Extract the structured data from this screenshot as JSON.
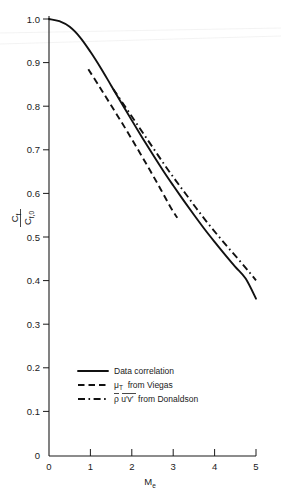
{
  "chart_data": {
    "type": "line",
    "title": "",
    "xlabel": "M_e",
    "ylabel": "C_f / C_f,0",
    "xlim": [
      0,
      5
    ],
    "ylim": [
      0,
      1.0
    ],
    "grid": false,
    "legend_position": "lower-left-inside",
    "x_ticks": [
      "0",
      "1",
      "2",
      "3",
      "4",
      "5"
    ],
    "x_tick_values": [
      0,
      1,
      2,
      3,
      4,
      5
    ],
    "y_ticks": [
      "0",
      "0.1",
      "0.2",
      "0.3",
      "0.4",
      "0.5",
      "0.6",
      "0.7",
      "0.8",
      "0.9",
      "1.0"
    ],
    "y_tick_values": [
      0,
      0.1,
      0.2,
      0.3,
      0.4,
      0.5,
      0.6,
      0.7,
      0.8,
      0.9,
      1.0
    ],
    "series": [
      {
        "name": "Data correlation",
        "style": "solid",
        "x": [
          0,
          0.25,
          0.5,
          0.75,
          1.0,
          1.25,
          1.5,
          1.75,
          2.0,
          2.25,
          2.5,
          2.75,
          3.0,
          3.25,
          3.5,
          3.75,
          4.0,
          4.25,
          4.5,
          4.75,
          5.0
        ],
        "y": [
          1.0,
          0.995,
          0.982,
          0.958,
          0.925,
          0.888,
          0.848,
          0.808,
          0.768,
          0.729,
          0.691,
          0.654,
          0.619,
          0.585,
          0.552,
          0.52,
          0.49,
          0.461,
          0.433,
          0.406,
          0.36
        ]
      },
      {
        "name": "mu_T from Viegas",
        "style": "dashed",
        "x": [
          0.95,
          1.2,
          1.45,
          1.7,
          1.95,
          2.2,
          2.45,
          2.7,
          2.95,
          3.1
        ],
        "y": [
          0.885,
          0.848,
          0.81,
          0.772,
          0.733,
          0.693,
          0.652,
          0.61,
          0.567,
          0.545
        ]
      },
      {
        "name": "rho u'v' from Donaldson",
        "style": "dash-dot",
        "x": [
          1.55,
          1.8,
          2.05,
          2.3,
          2.55,
          2.8,
          3.05,
          3.3,
          3.55,
          3.8,
          4.05,
          4.3,
          4.55,
          4.8,
          5.0
        ],
        "y": [
          0.84,
          0.805,
          0.77,
          0.735,
          0.7,
          0.665,
          0.632,
          0.6,
          0.568,
          0.537,
          0.508,
          0.48,
          0.453,
          0.425,
          0.402
        ]
      }
    ]
  },
  "axis": {
    "y_title_numerator": "C",
    "y_title_num_sub": "f",
    "y_title_denominator": "C",
    "y_title_den_sub": "f,0",
    "x_title_main": "M",
    "x_title_sub": "e"
  },
  "legend": {
    "items": [
      {
        "label": "Data correlation",
        "style": "solid"
      },
      {
        "label": "from Viegas",
        "symbol": "μ",
        "symbol_sub": "T",
        "style": "dashed"
      },
      {
        "label": "from Donaldson",
        "symbol": "ρ u′v′",
        "style": "dash-dot"
      }
    ]
  }
}
